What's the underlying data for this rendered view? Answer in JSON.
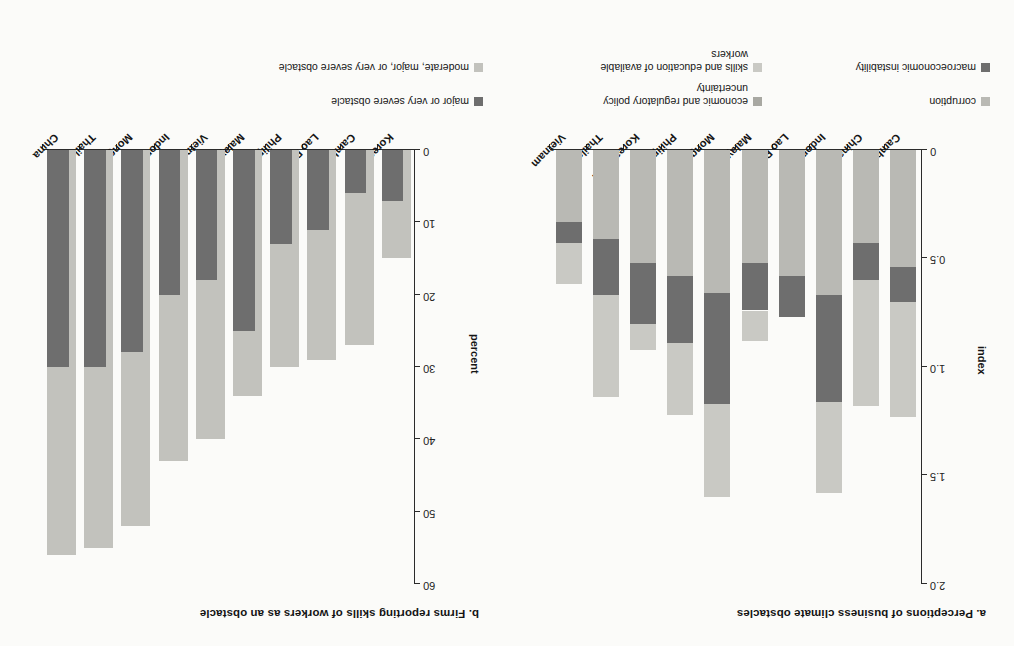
{
  "figure": {
    "background": "#fbfbf9"
  },
  "colors": {
    "corruption": "#b9b9b4",
    "policy_uncertainty": "#a8a8a2",
    "macro_instability": "#6e6e6e",
    "skills_education": "#c9c9c4",
    "major_or_very_severe": "#6e6e6e",
    "moderate_major_very_severe": "#c2c2bd",
    "axis": "#2b2b2b",
    "text": "#141414"
  },
  "panel_a": {
    "title": "a. Perceptions of business climate obstacles",
    "ylabel": "index",
    "yticks": [
      "0",
      "0.5",
      "1.0",
      "1.5",
      "2.0"
    ],
    "legend": [
      {
        "label": "corruption",
        "color_key": "corruption"
      },
      {
        "label": "economic and regulatory policy\nuncertainty",
        "color_key": "policy_uncertainty"
      },
      {
        "label": "macroeconomic instability",
        "color_key": "macro_instability"
      },
      {
        "label": "skills and education of available\nworkers",
        "color_key": "skills_education"
      }
    ]
  },
  "panel_b": {
    "title": "b. Firms reporting skills of workers as an obstacle",
    "ylabel": "percent",
    "yticks": [
      "0",
      "10",
      "20",
      "30",
      "40",
      "50",
      "60"
    ],
    "legend": [
      {
        "label": "major or very severe obstacle",
        "color_key": "major_or_very_severe"
      },
      {
        "label": "moderate, major, or very severe obstacle",
        "color_key": "moderate_major_very_severe"
      }
    ]
  },
  "chart_data": [
    {
      "type": "bar",
      "subtype": "stacked-vertical",
      "title": "a. Perceptions of business climate obstacles",
      "xlabel": "",
      "ylabel": "index",
      "ylim": [
        0,
        2.0
      ],
      "yticks": [
        0,
        0.5,
        1.0,
        1.5,
        2.0
      ],
      "grid": false,
      "legend_position": "below",
      "categories": [
        "Cambodia",
        "China",
        "Indonesia",
        "Lao PDR",
        "Malaysia",
        "Mongolia",
        "Philippines",
        "Korea, Rep.",
        "Thailand",
        "Vietnam"
      ],
      "series": [
        {
          "name": "corruption",
          "values": [
            0.54,
            0.43,
            0.67,
            0.58,
            0.52,
            0.66,
            0.58,
            0.52,
            0.41,
            0.33
          ]
        },
        {
          "name": "macroeconomic instability",
          "values": [
            0.16,
            0.17,
            0.49,
            0.19,
            0.22,
            0.51,
            0.31,
            0.28,
            0.26,
            0.1
          ]
        },
        {
          "name": "economic and regulatory policy uncertainty",
          "values": [
            0.0,
            0.0,
            0.0,
            0.0,
            0.0,
            0.0,
            0.0,
            0.0,
            0.0,
            0.0
          ]
        },
        {
          "name": "skills and education of available workers",
          "values": [
            0.53,
            0.58,
            0.42,
            0.0,
            0.14,
            0.43,
            0.33,
            0.12,
            0.47,
            0.19
          ]
        }
      ],
      "totals": [
        1.23,
        1.18,
        1.58,
        0.77,
        0.88,
        1.6,
        1.22,
        0.92,
        1.14,
        0.62
      ]
    },
    {
      "type": "bar",
      "subtype": "grouped-vertical",
      "title": "b. Firms reporting skills of workers as an obstacle",
      "xlabel": "",
      "ylabel": "percent",
      "ylim": [
        0,
        60
      ],
      "yticks": [
        0,
        10,
        20,
        30,
        40,
        50,
        60
      ],
      "grid": false,
      "legend_position": "below",
      "categories": [
        "Korea, Rep.",
        "Cambodia",
        "Lao PDR",
        "Philippines",
        "Malaysia",
        "Vietnam",
        "Indonesia",
        "Mongolia",
        "Thailand",
        "China"
      ],
      "series": [
        {
          "name": "major or very severe obstacle",
          "values": [
            7,
            6,
            11,
            13,
            25,
            18,
            20,
            28,
            30,
            30
          ]
        },
        {
          "name": "moderate, major, or very severe obstacle",
          "values": [
            15,
            27,
            29,
            30,
            34,
            40,
            43,
            52,
            55,
            56
          ]
        }
      ]
    }
  ]
}
